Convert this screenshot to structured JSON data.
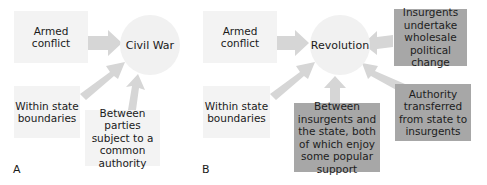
{
  "diagram_a": {
    "label": "A",
    "center": "Civil War",
    "inputs": [
      {
        "text": "Armed conflict"
      },
      {
        "text": "Within state boundaries"
      },
      {
        "text": "Between parties subject to a common authority"
      }
    ]
  },
  "diagram_b": {
    "label": "B",
    "center": "Revolution",
    "inputs": [
      {
        "text": "Armed conflict"
      },
      {
        "text": "Within state boundaries"
      },
      {
        "text": "Between insurgents and the state, both of which enjoy some popular support"
      },
      {
        "text": "Insurgents undertake wholesale political change"
      },
      {
        "text": "Authority transferred from state to insurgents"
      }
    ]
  },
  "colors": {
    "light_box": "#f3f3f3",
    "dark_box": "#a7a7a7",
    "circle": "#f1f1f1",
    "arrow": "#d6d6d6",
    "text": "#1a1a1a"
  }
}
